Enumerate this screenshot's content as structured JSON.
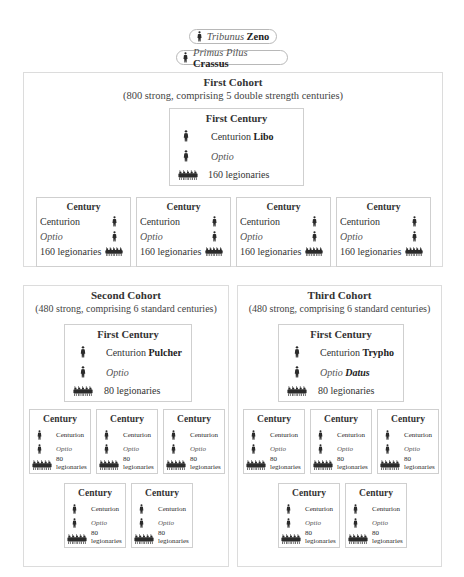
{
  "command": {
    "tribunus": {
      "rank": "Tribunus",
      "name": "Zeno",
      "icon": "soldier-icon"
    },
    "primus_pilus": {
      "rank": "Primus Pilus",
      "name": "Crassus",
      "icon": "soldier-icon"
    }
  },
  "cohorts": [
    {
      "title": "First Cohort",
      "subtitle": "(800 strong,  comprising 5 double strength centuries)",
      "first_century": {
        "title": "First Century",
        "centurion_label": "Centurion",
        "centurion_name": "Libo",
        "optio_label": "Optio",
        "optio_name": "",
        "legionaries": "160 legionaries"
      },
      "centuries": [
        {
          "title": "Century",
          "centurion": "Centurion",
          "optio": "Optio",
          "legionaries": "160 legionaries"
        },
        {
          "title": "Century",
          "centurion": "Centurion",
          "optio": "Optio",
          "legionaries": "160 legionaries"
        },
        {
          "title": "Century",
          "centurion": "Centurion",
          "optio": "Optio",
          "legionaries": "160 legionaries"
        },
        {
          "title": "Century",
          "centurion": "Centurion",
          "optio": "Optio",
          "legionaries": "160 legionaries"
        }
      ]
    },
    {
      "title": "Second Cohort",
      "subtitle": "(480 strong, comprising 6 standard centuries)",
      "first_century": {
        "title": "First Century",
        "centurion_label": "Centurion",
        "centurion_name": "Pulcher",
        "optio_label": "Optio",
        "optio_name": "",
        "legionaries": "80 legionaries"
      },
      "centuries": [
        {
          "title": "Century",
          "centurion": "Centurion",
          "optio": "Optio",
          "legionaries_num": "80",
          "legionaries_word": "legionaries"
        },
        {
          "title": "Century",
          "centurion": "Centurion",
          "optio": "Optio",
          "legionaries_num": "80",
          "legionaries_word": "legionaries"
        },
        {
          "title": "Century",
          "centurion": "Centurion",
          "optio": "Optio",
          "legionaries_num": "80",
          "legionaries_word": "legionaries"
        },
        {
          "title": "Century",
          "centurion": "Centurion",
          "optio": "Optio",
          "legionaries_num": "80",
          "legionaries_word": "legionaries"
        },
        {
          "title": "Century",
          "centurion": "Centurion",
          "optio": "Optio",
          "legionaries_num": "80",
          "legionaries_word": "legionaries"
        }
      ]
    },
    {
      "title": "Third Cohort",
      "subtitle": "(480 strong, comprising 6 standard centuries)",
      "first_century": {
        "title": "First Century",
        "centurion_label": "Centurion",
        "centurion_name": "Trypho",
        "optio_label": "Optio",
        "optio_name": "Datus",
        "legionaries": "80 legionaries"
      },
      "centuries": [
        {
          "title": "Century",
          "centurion": "Centurion",
          "optio": "Optio",
          "legionaries_num": "80",
          "legionaries_word": "legionaries"
        },
        {
          "title": "Century",
          "centurion": "Centurion",
          "optio": "Optio",
          "legionaries_num": "80",
          "legionaries_word": "legionaries"
        },
        {
          "title": "Century",
          "centurion": "Centurion",
          "optio": "Optio",
          "legionaries_num": "80",
          "legionaries_word": "legionaries"
        },
        {
          "title": "Century",
          "centurion": "Centurion",
          "optio": "Optio",
          "legionaries_num": "80",
          "legionaries_word": "legionaries"
        },
        {
          "title": "Century",
          "centurion": "Centurion",
          "optio": "Optio",
          "legionaries_num": "80",
          "legionaries_word": "legionaries"
        }
      ]
    }
  ],
  "icons": {
    "officer": "soldier-icon",
    "group": "legionaries-group-icon"
  },
  "colors": {
    "figure": "#2b2b2b",
    "border": "#cfcfcf",
    "text": "#333333"
  }
}
